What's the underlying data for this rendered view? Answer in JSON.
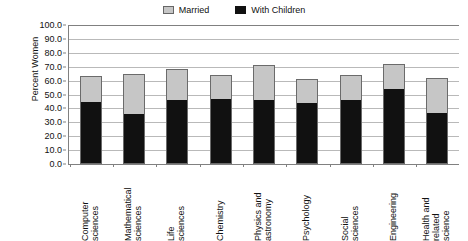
{
  "chart_data": {
    "type": "bar",
    "subtype": "stacked-bar",
    "title": "",
    "xlabel": "",
    "ylabel": "Percent Women",
    "ylim": [
      0.0,
      100.0
    ],
    "ytick_step": 10.0,
    "ytick_labels": [
      "100.0",
      "90.0",
      "80.0",
      "70.0",
      "60.0",
      "50.0",
      "40.0",
      "30.0",
      "20.0",
      "10.0",
      "0.0"
    ],
    "ytick_values": [
      100.0,
      90.0,
      80.0,
      70.0,
      60.0,
      50.0,
      40.0,
      30.0,
      20.0,
      10.0,
      0.0
    ],
    "grid": true,
    "legend_position": "top-center",
    "categories": [
      "Computer sciences",
      "Mathematical sciences",
      "Life sciences",
      "Chemistry",
      "Physics and astronomy",
      "Psychology",
      "Social sciences",
      "Engineering",
      "Health and related science"
    ],
    "category_lines": [
      [
        "Computer",
        "sciences"
      ],
      [
        "Mathematical",
        "sciences"
      ],
      [
        "Life",
        "sciences"
      ],
      [
        "Chemistry"
      ],
      [
        "Physics and",
        "astronomy"
      ],
      [
        "Psychology"
      ],
      [
        "Social",
        "sciences"
      ],
      [
        "Engineering"
      ],
      [
        "Health and",
        "related",
        "science"
      ]
    ],
    "series": [
      {
        "name": "Married",
        "color": "#c6c6c6",
        "stacked_total": true,
        "values": [
          63,
          65,
          68,
          64,
          71,
          61,
          64,
          72,
          62
        ]
      },
      {
        "name": "With Children",
        "color": "#111111",
        "values": [
          44,
          35,
          45,
          46,
          45,
          43,
          45,
          53,
          36
        ]
      }
    ]
  },
  "legend": {
    "entries": [
      {
        "label": "Married",
        "swatch": "married-swatch"
      },
      {
        "label": "With Children",
        "swatch": "with-children-swatch"
      }
    ]
  },
  "axis": {
    "y_title": "Percent Women"
  },
  "colors": {
    "married": "#c6c6c6",
    "with_children": "#111111",
    "gridline": "#b9b9b9",
    "axis": "#808080",
    "background": "#ffffff"
  }
}
